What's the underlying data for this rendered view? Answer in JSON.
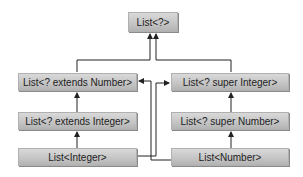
{
  "diagram": {
    "nodes": [
      {
        "id": "list-wildcard",
        "label": "List<?>"
      },
      {
        "id": "list-extends-number",
        "label": "List<? extends Number>"
      },
      {
        "id": "list-super-integer",
        "label": "List<? super Integer>"
      },
      {
        "id": "list-extends-integer",
        "label": "List<? extends Integer>"
      },
      {
        "id": "list-super-number",
        "label": "List<? super Number>"
      },
      {
        "id": "list-integer",
        "label": "List<Integer>"
      },
      {
        "id": "list-number",
        "label": "List<Number>"
      }
    ],
    "edges": [
      {
        "from": "list-extends-number",
        "to": "list-wildcard"
      },
      {
        "from": "list-super-integer",
        "to": "list-wildcard"
      },
      {
        "from": "list-extends-integer",
        "to": "list-extends-number"
      },
      {
        "from": "list-integer",
        "to": "list-extends-integer"
      },
      {
        "from": "list-super-number",
        "to": "list-super-integer"
      },
      {
        "from": "list-number",
        "to": "list-super-number"
      },
      {
        "from": "list-integer",
        "to": "list-super-integer"
      },
      {
        "from": "list-number",
        "to": "list-extends-number"
      }
    ],
    "colors": {
      "box": "#c4c4c4",
      "line": "#222222",
      "text": "#222222"
    }
  }
}
